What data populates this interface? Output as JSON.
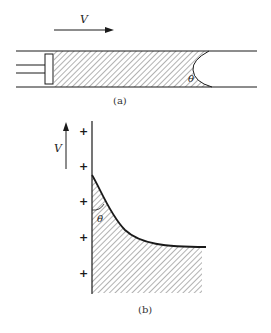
{
  "figure": {
    "part_a": {
      "caption": "(a)",
      "velocity_label": "V",
      "angle_label": "θ",
      "description": "Piston pushing liquid through a capillary tube; meniscus with contact angle θ"
    },
    "part_b": {
      "caption": "(b)",
      "velocity_label": "V",
      "angle_label": "θ",
      "plus_signs": [
        "+",
        "+",
        "+",
        "+",
        "+"
      ],
      "description": "Moving wall with liquid meniscus forming contact angle θ"
    },
    "colors": {
      "line": "#1a1a1a",
      "hatch": "#555555",
      "background": "#ffffff"
    }
  }
}
